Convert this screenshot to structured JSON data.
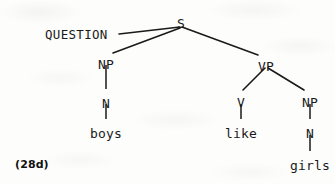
{
  "figure": {
    "example_number": "(28d)",
    "type": "syntax-tree",
    "ink_color": "#1a1a1a",
    "background_color": "#fdfdfc"
  },
  "tree": {
    "root": {
      "id": "s",
      "label": "S",
      "x": 181,
      "y": 17
    },
    "feature": {
      "id": "question",
      "label": "QUESTION",
      "x": 45,
      "y": 28
    },
    "nodes": [
      {
        "id": "np-subject",
        "label": "NP",
        "x": 106,
        "y": 58
      },
      {
        "id": "n-subject",
        "label": "N",
        "x": 106,
        "y": 97
      },
      {
        "id": "vp",
        "label": "VP",
        "x": 266,
        "y": 60
      },
      {
        "id": "v",
        "label": "V",
        "x": 241,
        "y": 96
      },
      {
        "id": "np-object",
        "label": "NP",
        "x": 310,
        "y": 96
      },
      {
        "id": "n-object",
        "label": "N",
        "x": 310,
        "y": 127
      }
    ],
    "terminals": [
      {
        "id": "boys",
        "label": "boys",
        "x": 106,
        "y": 127
      },
      {
        "id": "like",
        "label": "like",
        "x": 241,
        "y": 127
      },
      {
        "id": "girls",
        "label": "girls",
        "x": 310,
        "y": 159
      }
    ],
    "edges": [
      {
        "id": "edge-question-s",
        "from": "question",
        "to": "s",
        "x1": 119,
        "y1": 34,
        "x2": 180,
        "y2": 27
      },
      {
        "id": "edge-s-np",
        "from": "s",
        "to": "np-subject",
        "x1": 180,
        "y1": 28,
        "x2": 113,
        "y2": 53
      },
      {
        "id": "edge-s-vp",
        "from": "s",
        "to": "vp",
        "x1": 182,
        "y1": 27,
        "x2": 258,
        "y2": 55
      },
      {
        "id": "edge-np-n-subject",
        "from": "np-subject",
        "to": "n-subject",
        "x1": 106,
        "y1": 64,
        "x2": 106,
        "y2": 90
      },
      {
        "id": "edge-n-boys",
        "from": "n-subject",
        "to": "boys",
        "x1": 106,
        "y1": 103,
        "x2": 106,
        "y2": 120
      },
      {
        "id": "edge-vp-v",
        "from": "vp",
        "to": "v",
        "x1": 265,
        "y1": 68,
        "x2": 243,
        "y2": 90
      },
      {
        "id": "edge-vp-np",
        "from": "vp",
        "to": "np-object",
        "x1": 268,
        "y1": 68,
        "x2": 304,
        "y2": 90
      },
      {
        "id": "edge-v-like",
        "from": "v",
        "to": "like",
        "x1": 241,
        "y1": 103,
        "x2": 241,
        "y2": 120
      },
      {
        "id": "edge-np-n-object",
        "from": "np-object",
        "to": "n-object",
        "x1": 310,
        "y1": 103,
        "x2": 310,
        "y2": 120
      },
      {
        "id": "edge-n-girls",
        "from": "n-object",
        "to": "girls",
        "x1": 310,
        "y1": 134,
        "x2": 310,
        "y2": 152
      }
    ]
  }
}
